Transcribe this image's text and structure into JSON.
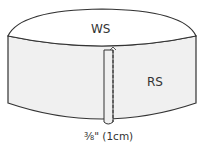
{
  "diagram": {
    "labels": {
      "top": "WS",
      "side": "RS",
      "seam": "⅜\" (1cm)"
    },
    "colors": {
      "stroke": "#333333",
      "band_fill": "#f0f0f0",
      "top_fill": "#ffffff"
    }
  }
}
